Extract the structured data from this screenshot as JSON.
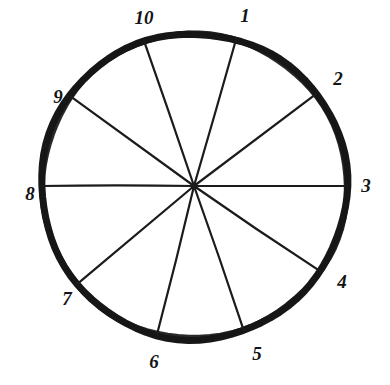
{
  "figure": {
    "geometry": {
      "center_x": 194,
      "center_y": 186,
      "radius": 153,
      "rim_color": "#171717",
      "spoke_color": "#1b1b1b",
      "background": "#ffffff",
      "rim_stroke_width": 7,
      "spoke_stroke_width": 2.2
    },
    "sectors": [
      {
        "label": "1",
        "boundary_angle_deg": 74,
        "label_x": 245,
        "label_y": 22
      },
      {
        "label": "2",
        "boundary_angle_deg": 37,
        "label_x": 338,
        "label_y": 85
      },
      {
        "label": "3",
        "boundary_angle_deg": 0,
        "label_x": 366,
        "label_y": 192
      },
      {
        "label": "4",
        "boundary_angle_deg": -34,
        "label_x": 342,
        "label_y": 288
      },
      {
        "label": "5",
        "boundary_angle_deg": -71,
        "label_x": 257,
        "label_y": 360
      },
      {
        "label": "6",
        "boundary_angle_deg": -104,
        "label_x": 154,
        "label_y": 368
      },
      {
        "label": "7",
        "boundary_angle_deg": -140,
        "label_x": 67,
        "label_y": 305
      },
      {
        "label": "8",
        "boundary_angle_deg": 180,
        "label_x": 30,
        "label_y": 200
      },
      {
        "label": "9",
        "boundary_angle_deg": 144,
        "label_x": 58,
        "label_y": 103
      },
      {
        "label": "10",
        "boundary_angle_deg": 109,
        "label_x": 144,
        "label_y": 24
      }
    ]
  }
}
